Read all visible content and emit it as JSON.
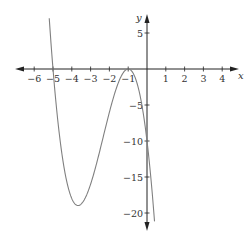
{
  "chart_data": {
    "type": "line",
    "title": "",
    "xlabel": "x",
    "ylabel": "y",
    "xlim": [
      -7,
      4.5
    ],
    "ylim": [
      -22.5,
      8
    ],
    "grid": false,
    "legend": null,
    "x_ticks": [
      -6,
      -5,
      -4,
      -3,
      -2,
      -1,
      1,
      2,
      3,
      4
    ],
    "x_tick_labels": [
      "−6",
      "−5",
      "−4",
      "−3",
      "−2",
      "−1",
      "1",
      "2",
      "3",
      "4"
    ],
    "y_ticks": [
      5,
      -5,
      -10,
      -15,
      -20
    ],
    "y_tick_labels": [
      "5",
      "−5",
      "−10",
      "−15",
      "−20"
    ],
    "series": [
      {
        "name": "y = -2(x+5)(x+1)^2",
        "color": "#808080",
        "x": [
          -5.2,
          -5.0,
          -4.5,
          -4.0,
          -3.67,
          -3.0,
          -2.5,
          -2.0,
          -1.5,
          -1.0,
          -0.5,
          0.0,
          0.3,
          0.4
        ],
        "y": [
          7.0,
          0.0,
          -12.25,
          -18.0,
          -18.96,
          -16.0,
          -11.25,
          -6.0,
          -1.75,
          0.0,
          -2.25,
          -10.0,
          -18.25,
          -21.6
        ]
      }
    ],
    "annotations": {
      "x_intercepts": [
        -5,
        -1
      ],
      "y_intercept": -10,
      "local_min": [
        -3.67,
        -18.96
      ],
      "local_max": [
        -1,
        0
      ]
    }
  }
}
